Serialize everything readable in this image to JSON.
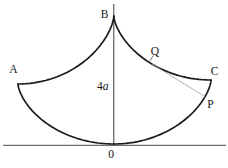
{
  "figure": {
    "points": {
      "a": "A",
      "b": "B",
      "c": "C",
      "q": "Q",
      "p": "P",
      "origin": "0"
    },
    "measurements": {
      "axis_length_coefficient": "4",
      "axis_length_variable": "a"
    },
    "colors": {
      "background": "#ffffff",
      "curve": "#1b1b1b",
      "axis": "#3f3f3f",
      "baseline": "#6f6f6f",
      "string": "#a0a0a0",
      "leader": "#555555",
      "label": "#141414"
    }
  }
}
